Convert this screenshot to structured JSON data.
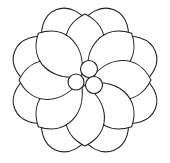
{
  "image": {
    "title": "Flower Line Drawing",
    "subject": "flower",
    "style": "black-and-white line art / coloring page outline",
    "width": 170,
    "height": 163,
    "background_color": "#ffffff",
    "stroke_color": "#231f20",
    "fill_color": "#ffffff",
    "stroke_width": 1.1
  },
  "drawing": {
    "center": {
      "x": 85,
      "y": 80
    },
    "back_layer": {
      "name": "back-petal-ring",
      "count": 8,
      "description": "rounded scalloped petals peeking out between the front petals",
      "radius_from_center": 46,
      "petal_rx": 25,
      "petal_ry": 30,
      "start_angle_deg": -67.5,
      "angles_deg": [
        -67.5,
        -22.5,
        22.5,
        67.5,
        112.5,
        157.5,
        202.5,
        247.5
      ]
    },
    "front_layer": {
      "name": "front-petal-ring",
      "count": 8,
      "description": "long teardrop petals radiating from the center cluster",
      "tip_distance": 66,
      "petal_half_width": 27,
      "angles_deg": [
        -90,
        -45,
        0,
        45,
        90,
        135,
        180,
        225
      ]
    },
    "center_cluster": {
      "name": "center-circles",
      "count": 3,
      "circles": [
        {
          "label": "top-circle",
          "cx": 89,
          "cy": 69,
          "r": 8.5
        },
        {
          "label": "left-circle",
          "cx": 76,
          "cy": 82,
          "r": 8.0
        },
        {
          "label": "right-circle",
          "cx": 94,
          "cy": 85,
          "r": 8.5
        }
      ]
    }
  }
}
